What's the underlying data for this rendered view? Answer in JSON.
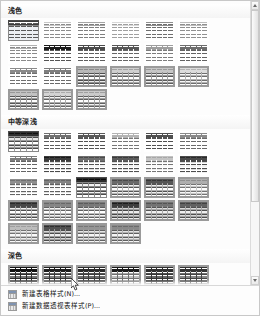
{
  "gallery": {
    "title": "表格样式",
    "sections": [
      {
        "id": "light",
        "title": "浅色",
        "rows": 3,
        "cols": 7,
        "styles": [
          {
            "name": "浅色样式 1 - 强调 1",
            "header": "#ffffff",
            "headerLine": "#3c3c3c",
            "band": "#f2f2f2",
            "alt": "#ffffff",
            "text": "#595959",
            "border": "#bfbfbf",
            "selected": true,
            "variant": "topline"
          },
          {
            "name": "浅色样式 2 - 强调 1",
            "header": "#ffffff",
            "headerLine": "#c8c8c8",
            "band": "#fafafa",
            "alt": "#ffffff",
            "text": "#8c8c8c",
            "border": "#e4e4e4",
            "selected": false,
            "variant": "plain"
          },
          {
            "name": "浅色样式 3 - 强调 2",
            "header": "#ffffff",
            "headerLine": "#a6a6a6",
            "band": "#f7f7f7",
            "alt": "#ffffff",
            "text": "#7f7f7f",
            "border": "#d9d9d9",
            "selected": false,
            "variant": "plain"
          },
          {
            "name": "浅色样式 4 - 强调 3",
            "header": "#ffffff",
            "headerLine": "#d8d8d8",
            "band": "#fcfcfc",
            "alt": "#ffffff",
            "text": "#a0a0a0",
            "border": "#ededed",
            "selected": false,
            "variant": "plain"
          },
          {
            "name": "浅色样式 5 - 强调 4",
            "header": "#ffffff",
            "headerLine": "#8f8f8f",
            "band": "#f4f4f4",
            "alt": "#ffffff",
            "text": "#6e6e6e",
            "border": "#cfcfcf",
            "selected": false,
            "variant": "plain"
          },
          {
            "name": "浅色样式 6 - 强调 5",
            "header": "#ffffff",
            "headerLine": "#bdbdbd",
            "band": "#f9f9f9",
            "alt": "#ffffff",
            "text": "#909090",
            "border": "#e0e0e0",
            "selected": false,
            "variant": "plain"
          },
          {
            "name": "浅色样式 7 - 强调 6",
            "header": "#ffffff",
            "headerLine": "#b0b0b0",
            "band": "#f8f8f8",
            "alt": "#ffffff",
            "text": "#8a8a8a",
            "border": "#dedede",
            "selected": false,
            "variant": "plain"
          },
          {
            "name": "浅色样式 8",
            "header": "#1c1c1c",
            "headerLine": "#000000",
            "band": "#f0f0f0",
            "alt": "#ffffff",
            "text": "#555555",
            "border": "#b8b8b8",
            "selected": false,
            "variant": "darkhdr"
          },
          {
            "name": "浅色样式 9",
            "header": "#4a4a4a",
            "headerLine": "#333333",
            "band": "#f1f1f1",
            "alt": "#ffffff",
            "text": "#5e5e5e",
            "border": "#c2c2c2",
            "selected": false,
            "variant": "darkhdr"
          },
          {
            "name": "浅色样式 10",
            "header": "#575757",
            "headerLine": "#3d3d3d",
            "band": "#f3f3f3",
            "alt": "#ffffff",
            "text": "#666666",
            "border": "#c6c6c6",
            "selected": false,
            "variant": "darkhdr"
          },
          {
            "name": "浅色样式 11",
            "header": "#9e9e9e",
            "headerLine": "#8a8a8a",
            "band": "#f8f8f8",
            "alt": "#ffffff",
            "text": "#7d7d7d",
            "border": "#d6d6d6",
            "selected": false,
            "variant": "darkhdr"
          },
          {
            "name": "浅色样式 12",
            "header": "#6d6d6d",
            "headerLine": "#525252",
            "band": "#f2f2f2",
            "alt": "#ffffff",
            "text": "#636363",
            "border": "#c4c4c4",
            "selected": false,
            "variant": "darkhdr"
          },
          {
            "name": "浅色样式 13",
            "header": "#8a8a8a",
            "headerLine": "#6f6f6f",
            "band": "#f5f5f5",
            "alt": "#ffffff",
            "text": "#707070",
            "border": "#cccccc",
            "selected": false,
            "variant": "darkhdr"
          },
          {
            "name": "浅色样式 14",
            "header": "#7e7e7e",
            "headerLine": "#636363",
            "band": "#f4f4f4",
            "alt": "#ffffff",
            "text": "#6b6b6b",
            "border": "#c9c9c9",
            "selected": false,
            "variant": "darkhdr"
          },
          {
            "name": "浅色样式 15",
            "header": "#b8b8b8",
            "headerLine": "#8a8a8a",
            "band": "#ededed",
            "alt": "#ffffff",
            "text": "#4f4f4f",
            "border": "#8f8f8f",
            "selected": false,
            "variant": "grid"
          },
          {
            "name": "浅色样式 16",
            "header": "#cfcfcf",
            "headerLine": "#a3a3a3",
            "band": "#f4f4f4",
            "alt": "#ffffff",
            "text": "#606060",
            "border": "#a6a6a6",
            "selected": false,
            "variant": "grid"
          },
          {
            "name": "浅色样式 17",
            "header": "#c6c6c6",
            "headerLine": "#9b9b9b",
            "band": "#f1f1f1",
            "alt": "#ffffff",
            "text": "#5c5c5c",
            "border": "#9e9e9e",
            "selected": false,
            "variant": "grid"
          },
          {
            "name": "浅色样式 18",
            "header": "#dcdcdc",
            "headerLine": "#b4b4b4",
            "band": "#f8f8f8",
            "alt": "#ffffff",
            "text": "#6e6e6e",
            "border": "#b4b4b4",
            "selected": false,
            "variant": "grid"
          },
          {
            "name": "浅色样式 19",
            "header": "#c2c2c2",
            "headerLine": "#979797",
            "band": "#f0f0f0",
            "alt": "#ffffff",
            "text": "#585858",
            "border": "#9a9a9a",
            "selected": false,
            "variant": "grid"
          },
          {
            "name": "浅色样式 20",
            "header": "#d4d4d4",
            "headerLine": "#aaaaaa",
            "band": "#f6f6f6",
            "alt": "#ffffff",
            "text": "#666666",
            "border": "#ababab",
            "selected": false,
            "variant": "grid"
          },
          {
            "name": "浅色样式 21",
            "header": "#cbcbcb",
            "headerLine": "#a0a0a0",
            "band": "#f3f3f3",
            "alt": "#ffffff",
            "text": "#616161",
            "border": "#a2a2a2",
            "selected": false,
            "variant": "grid"
          }
        ]
      },
      {
        "id": "medium",
        "title": "中等深浅",
        "rows": 4,
        "cols": 7,
        "styles": [
          {
            "name": "中等深浅样式 1",
            "header": "#2f2f2f",
            "headerLine": "#101010",
            "band": "#e8e8e8",
            "alt": "#ffffff",
            "text": "#4a4a4a",
            "border": "#9c9c9c",
            "selected": true,
            "variant": "grid"
          },
          {
            "name": "中等深浅样式 2",
            "header": "#707070",
            "headerLine": "#4d4d4d",
            "band": "#efefef",
            "alt": "#ffffff",
            "text": "#5b5b5b",
            "border": "#c2c2c2",
            "selected": false,
            "variant": "darkhdr"
          },
          {
            "name": "中等深浅样式 3",
            "header": "#5a5a5a",
            "headerLine": "#3a3a3a",
            "band": "#ececec",
            "alt": "#ffffff",
            "text": "#535353",
            "border": "#bdbdbd",
            "selected": false,
            "variant": "darkhdr"
          },
          {
            "name": "中等深浅样式 4",
            "header": "#b4b4b4",
            "headerLine": "#9a9a9a",
            "band": "#f6f6f6",
            "alt": "#ffffff",
            "text": "#777777",
            "border": "#d2d2d2",
            "selected": false,
            "variant": "darkhdr"
          },
          {
            "name": "中等深浅样式 5",
            "header": "#4f4f4f",
            "headerLine": "#333333",
            "band": "#eaeaea",
            "alt": "#ffffff",
            "text": "#505050",
            "border": "#bababa",
            "selected": false,
            "variant": "darkhdr"
          },
          {
            "name": "中等深浅样式 6",
            "header": "#8a8a8a",
            "headerLine": "#6a6a6a",
            "band": "#f2f2f2",
            "alt": "#ffffff",
            "text": "#6a6a6a",
            "border": "#c8c8c8",
            "selected": false,
            "variant": "darkhdr"
          },
          {
            "name": "中等深浅样式 7",
            "header": "#7c7c7c",
            "headerLine": "#5e5e5e",
            "band": "#f0f0f0",
            "alt": "#ffffff",
            "text": "#656565",
            "border": "#c5c5c5",
            "selected": false,
            "variant": "darkhdr"
          },
          {
            "name": "中等深浅样式 8",
            "header": "#3a3a3a",
            "headerLine": "#1a1a1a",
            "band": "#d9d9d9",
            "alt": "#f2f2f2",
            "text": "#4a4a4a",
            "border": "#a9a9a9",
            "selected": false,
            "variant": "banded"
          },
          {
            "name": "中等深浅样式 9",
            "header": "#6e6e6e",
            "headerLine": "#4a4a4a",
            "band": "#dedede",
            "alt": "#f4f4f4",
            "text": "#555555",
            "border": "#b2b2b2",
            "selected": false,
            "variant": "banded"
          },
          {
            "name": "中等深浅样式 10",
            "header": "#5c5c5c",
            "headerLine": "#3c3c3c",
            "band": "#dcdcdc",
            "alt": "#f3f3f3",
            "text": "#515151",
            "border": "#b0b0b0",
            "selected": false,
            "variant": "banded"
          },
          {
            "name": "中等深浅样式 11",
            "header": "#c4c4c4",
            "headerLine": "#a8a8a8",
            "band": "#ececec",
            "alt": "#fafafa",
            "text": "#767676",
            "border": "#cdcdcd",
            "selected": false,
            "variant": "banded"
          },
          {
            "name": "中等深浅样式 12",
            "header": "#4a4a4a",
            "headerLine": "#2b2b2b",
            "band": "#dadada",
            "alt": "#f2f2f2",
            "text": "#4d4d4d",
            "border": "#aeaeae",
            "selected": false,
            "variant": "banded"
          },
          {
            "name": "中等深浅样式 13",
            "header": "#8e8e8e",
            "headerLine": "#707070",
            "band": "#e4e4e4",
            "alt": "#f7f7f7",
            "text": "#646464",
            "border": "#bfbfbf",
            "selected": false,
            "variant": "banded"
          },
          {
            "name": "中等深浅样式 14",
            "header": "#828282",
            "headerLine": "#646464",
            "band": "#e2e2e2",
            "alt": "#f6f6f6",
            "text": "#606060",
            "border": "#bcbcbc",
            "selected": false,
            "variant": "banded"
          },
          {
            "name": "中等深浅样式 15",
            "header": "#2a2a2a",
            "headerLine": "#0a0a0a",
            "band": "#f4f4f4",
            "alt": "#ffffff",
            "text": "#4a4a4a",
            "border": "#8a8a8a",
            "selected": true,
            "variant": "grid"
          },
          {
            "name": "中等深浅样式 16",
            "header": "#6a6a6a",
            "headerLine": "#4a4a4a",
            "band": "#f2f2f2",
            "alt": "#ffffff",
            "text": "#585858",
            "border": "#b6b6b6",
            "selected": false,
            "variant": "grid"
          },
          {
            "name": "中等深浅样式 17",
            "header": "#565656",
            "headerLine": "#383838",
            "band": "#f0f0f0",
            "alt": "#ffffff",
            "text": "#525252",
            "border": "#b0b0b0",
            "selected": false,
            "variant": "grid"
          },
          {
            "name": "中等深浅样式 18",
            "header": "#aeaeae",
            "headerLine": "#8e8e8e",
            "band": "#f7f7f7",
            "alt": "#ffffff",
            "text": "#747474",
            "border": "#c8c8c8",
            "selected": false,
            "variant": "grid"
          },
          {
            "name": "中等深浅样式 19",
            "header": "#474747",
            "headerLine": "#2a2a2a",
            "band": "#efefef",
            "alt": "#ffffff",
            "text": "#4f4f4f",
            "border": "#ababab",
            "selected": false,
            "variant": "grid"
          },
          {
            "name": "中等深浅样式 20",
            "header": "#868686",
            "headerLine": "#686868",
            "band": "#f4f4f4",
            "alt": "#ffffff",
            "text": "#636363",
            "border": "#bebebe",
            "selected": false,
            "variant": "grid"
          },
          {
            "name": "中等深浅样式 21",
            "header": "#797979",
            "headerLine": "#5b5b5b",
            "band": "#f2f2f2",
            "alt": "#ffffff",
            "text": "#5e5e5e",
            "border": "#bababa",
            "selected": false,
            "variant": "grid"
          },
          {
            "name": "中等深浅样式 22",
            "header": "#3e3e3e",
            "headerLine": "#1c1c1c",
            "band": "#d2d2d2",
            "alt": "#ececec",
            "text": "#474747",
            "border": "#9c9c9c",
            "selected": false,
            "variant": "grid"
          },
          {
            "name": "中等深浅样式 23",
            "header": "#747474",
            "headerLine": "#545454",
            "band": "#dcdcdc",
            "alt": "#f1f1f1",
            "text": "#555555",
            "border": "#aaaaaa",
            "selected": false,
            "variant": "grid"
          },
          {
            "name": "中等深浅样式 24",
            "header": "#626262",
            "headerLine": "#424242",
            "band": "#d8d8d8",
            "alt": "#efefef",
            "text": "#505050",
            "border": "#a5a5a5",
            "selected": false,
            "variant": "grid"
          },
          {
            "name": "中等深浅样式 25",
            "header": "#bcbcbc",
            "headerLine": "#9e9e9e",
            "band": "#ececec",
            "alt": "#f9f9f9",
            "text": "#737373",
            "border": "#c2c2c2",
            "selected": false,
            "variant": "grid"
          },
          {
            "name": "中等深浅样式 26",
            "header": "#505050",
            "headerLine": "#2f2f2f",
            "band": "#d6d6d6",
            "alt": "#eeeeee",
            "text": "#4b4b4b",
            "border": "#a0a0a0",
            "selected": false,
            "variant": "grid"
          },
          {
            "name": "中等深浅样式 27",
            "header": "#949494",
            "headerLine": "#767676",
            "band": "#e6e6e6",
            "alt": "#f6f6f6",
            "text": "#626262",
            "border": "#b8b8b8",
            "selected": false,
            "variant": "grid"
          },
          {
            "name": "中等深浅样式 28",
            "header": "#8a8a8a",
            "headerLine": "#6c6c6c",
            "band": "#e4e4e4",
            "alt": "#f5f5f5",
            "text": "#5f5f5f",
            "border": "#b4b4b4",
            "selected": false,
            "variant": "grid"
          }
        ]
      },
      {
        "id": "dark",
        "title": "深色",
        "rows": 2,
        "cols": 7,
        "styles": [
          {
            "name": "深色样式 1",
            "header": "#121212",
            "headerLine": "#000000",
            "band": "#5c5c5c",
            "alt": "#767676",
            "text": "#ffffff",
            "border": "#2f2f2f",
            "selected": false,
            "variant": "darkgrid"
          },
          {
            "name": "深色样式 2",
            "header": "#1e1e1e",
            "headerLine": "#000000",
            "band": "#6a6a6a",
            "alt": "#828282",
            "text": "#ffffff",
            "border": "#3a3a3a",
            "selected": false,
            "variant": "darkgrid"
          },
          {
            "name": "深色样式 3",
            "header": "#2a2a2a",
            "headerLine": "#0e0e0e",
            "band": "#555555",
            "alt": "#6e6e6e",
            "text": "#ffffff",
            "border": "#3f3f3f",
            "selected": false,
            "variant": "darkgrid"
          },
          {
            "name": "深色样式 4",
            "header": "#1a1a1a",
            "headerLine": "#000000",
            "band": "#a8a8a8",
            "alt": "#c0c0c0",
            "text": "#ffffff",
            "border": "#707070",
            "selected": false,
            "variant": "darkgrid"
          },
          {
            "name": "深色样式 5",
            "header": "#2e2e2e",
            "headerLine": "#101010",
            "band": "#4f4f4f",
            "alt": "#676767",
            "text": "#ffffff",
            "border": "#363636",
            "selected": false,
            "variant": "darkgrid"
          },
          {
            "name": "深色样式 6",
            "header": "#333333",
            "headerLine": "#141414",
            "band": "#6f6f6f",
            "alt": "#888888",
            "text": "#ffffff",
            "border": "#454545",
            "selected": false,
            "variant": "darkgrid"
          },
          {
            "name": "深色样式 7",
            "header": "#2c2c2c",
            "headerLine": "#0c0c0c",
            "band": "#737373",
            "alt": "#8c8c8c",
            "text": "#ffffff",
            "border": "#424242",
            "selected": false,
            "variant": "darkgrid"
          },
          {
            "name": "深色样式 8",
            "header": "#161616",
            "headerLine": "#000000",
            "band": "#ffffff",
            "alt": "#ffffff",
            "text": "#4a4a4a",
            "border": "#b8b8b8",
            "selected": false,
            "variant": "darkhdr"
          },
          {
            "name": "深色样式 9",
            "header": "#9c9c9c",
            "headerLine": "#7e7e7e",
            "band": "#ffffff",
            "alt": "#ffffff",
            "text": "#6e6e6e",
            "border": "#d0d0d0",
            "selected": false,
            "variant": "darkhdr"
          },
          {
            "name": "深色样式 10",
            "header": "#8e8e8e",
            "headerLine": "#707070",
            "band": "#ffffff",
            "alt": "#ffffff",
            "text": "#6a6a6a",
            "border": "#cccccc",
            "selected": false,
            "variant": "darkhdr"
          },
          {
            "name": "深色样式 11",
            "header": "#bcbcbc",
            "headerLine": "#9e9e9e",
            "band": "#ffffff",
            "alt": "#ffffff",
            "text": "#7c7c7c",
            "border": "#dcdcdc",
            "selected": false,
            "variant": "darkhdr"
          }
        ]
      }
    ]
  },
  "menu": {
    "items": [
      {
        "icon": "new-table-style-icon",
        "label": "新建表格样式(N)..."
      },
      {
        "icon": "new-pivottable-style-icon",
        "label": "新建数据透视表样式(P)..."
      }
    ]
  },
  "scrollbar": {
    "up_arrow": "scroll-up-arrow",
    "down_arrow": "scroll-down-arrow",
    "thumb_position_percent": 0,
    "thumb_size_percent": 72
  },
  "cursor": {
    "x": 70,
    "y": 277,
    "type": "arrow-pointer"
  }
}
